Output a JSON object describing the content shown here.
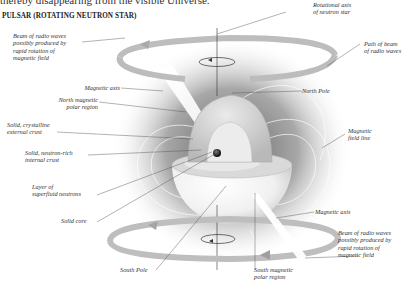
{
  "intro_text": "thereby disappearing from the visible Universe.",
  "title": "PULSAR (ROTATING NEUTRON STAR)",
  "labels": {
    "beam_top": "Beam of radio waves\npossibly produced by\nrapid rotation of\nmagnetic field",
    "magnetic_axis_top": "Magnetic axis",
    "north_magnetic_polar_region": "North magnetic\npolar region",
    "solid_crystalline_crust": "Solid, crystalline\nexternal crust",
    "neutron_rich_crust": "Solid, neutron-rich\ninternal crust",
    "superfluid_layer": "Layer of\nsuperfluid neutrons",
    "solid_core": "Solid core",
    "south_pole": "South Pole",
    "south_magnetic_polar_region": "South magnetic\npolar region",
    "beam_bottom": "Beam of radio waves\npossibly produced by\nrapid rotation of\nmagnetic field",
    "magnetic_axis_bottom": "Magnetic axis",
    "magnetic_field_line": "Magnetic\nfield line",
    "north_pole": "North Pole",
    "path_of_beam": "Path of beam\nof radio waves",
    "rotational_axis": "Rotational axis\nof neutron star"
  },
  "colors": {
    "beam_ring": "#b8b8b8",
    "glow": "#6e6e6e",
    "star_surface": "#f2f2f2",
    "cutaway": "#d6d6d6",
    "core": "#1a1a1a",
    "leader_line": "#555555"
  }
}
